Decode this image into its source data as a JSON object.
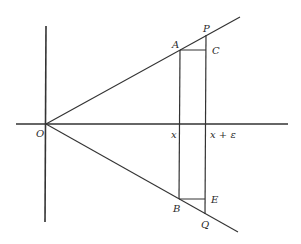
{
  "diagram": {
    "type": "geometry",
    "colors": {
      "line": "#333333",
      "text": "#2a2a2a",
      "background": "#ffffff"
    },
    "labels": {
      "origin": "O",
      "A": "A",
      "P": "P",
      "C": "C",
      "B": "B",
      "Q": "Q",
      "E": "E",
      "x": "x",
      "x_plus_eps": "x + ε"
    },
    "geometry": {
      "origin": [
        46,
        124
      ],
      "horizontal_axis": {
        "x1": 16,
        "x2": 288,
        "y": 124
      },
      "vertical_axis": {
        "x": 46,
        "y1": 26,
        "y2": 222
      },
      "upper_ray": {
        "from": [
          46,
          124
        ],
        "to": [
          240,
          17
        ]
      },
      "lower_ray": {
        "from": [
          46,
          124
        ],
        "to": [
          238,
          232
        ]
      },
      "x_line": {
        "x": 179,
        "y1": 50,
        "y2": 199
      },
      "x_eps_line": {
        "x": 206,
        "y1": 35,
        "y2": 214
      },
      "AC_segment": {
        "y": 50,
        "x1": 179,
        "x2": 206
      },
      "BE_segment": {
        "y": 199,
        "x1": 179,
        "x2": 206
      }
    }
  }
}
